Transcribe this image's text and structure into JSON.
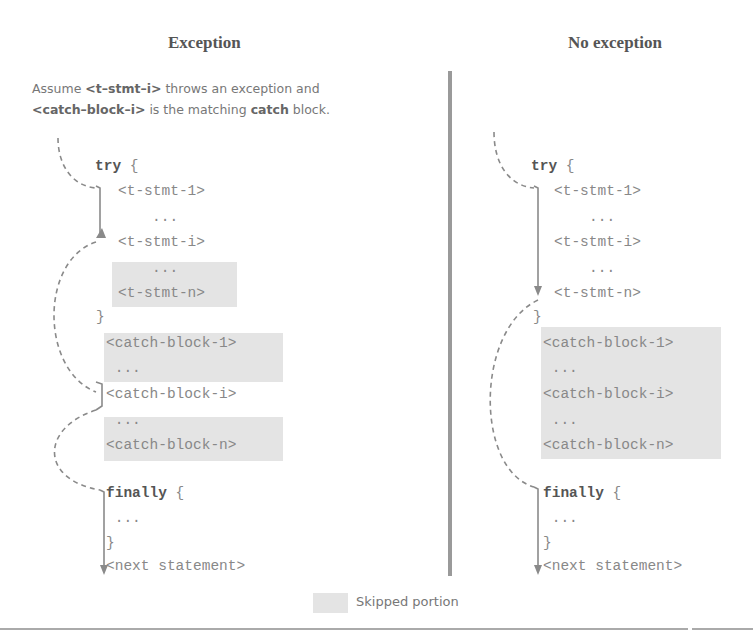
{
  "left": {
    "title": "Exception",
    "note_line1": {
      "pre": "Assume ",
      "b1": "<t–stmt–i>",
      "post": " throws an exception and"
    },
    "note_line2": {
      "b1": "<catch–block–i>",
      "mid": " is the matching ",
      "b2": "catch",
      "post": " block."
    },
    "code": {
      "try_kw": "try",
      "try_brace": " {",
      "t1": "<t-stmt-1>",
      "dots1": "...",
      "ti": "<t-stmt-i>",
      "dots2": "...",
      "tn": "<t-stmt-n>",
      "close1": "}",
      "c1": "<catch-block-1>",
      "cdots1": " ...",
      "ci": "<catch-block-i>",
      "cdots2": " ...",
      "cn": "<catch-block-n>",
      "finally_kw": "finally",
      "finally_brace": " {",
      "fdots": " ...",
      "close2": "}",
      "next": "<next statement>"
    }
  },
  "right": {
    "title": "No exception",
    "code": {
      "try_kw": "try",
      "try_brace": " {",
      "t1": "<t-stmt-1>",
      "dots1": "...",
      "ti": "<t-stmt-i>",
      "dots2": "...",
      "tn": "<t-stmt-n>",
      "close1": "}",
      "c1": "<catch-block-1>",
      "cdots1": " ...",
      "ci": "<catch-block-i>",
      "cdots2": " ...",
      "cn": "<catch-block-n>",
      "finally_kw": "finally",
      "finally_brace": " {",
      "fdots": " ...",
      "close2": "}",
      "next": "<next statement>"
    }
  },
  "legend": {
    "label": "Skipped portion",
    "swatch_color": "#e4e4e4"
  },
  "colors": {
    "divider": "#9a9a9a",
    "arrow": "#8a8a8a",
    "skip": "#e4e4e4"
  }
}
